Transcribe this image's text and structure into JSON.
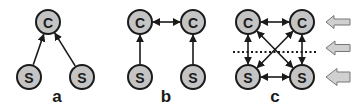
{
  "diagram": {
    "node_fill": "#c4c4c4",
    "stroke_color": "#1a1a1a",
    "panels": [
      {
        "id": "a",
        "label": "a",
        "nodes": [
          {
            "id": "a-c",
            "text": "C",
            "x": 48,
            "y": 22
          },
          {
            "id": "a-s1",
            "text": "S",
            "x": 29,
            "y": 77
          },
          {
            "id": "a-s2",
            "text": "S",
            "x": 82,
            "y": 77
          }
        ],
        "edges": [
          {
            "from": "a-s1",
            "to": "a-c",
            "type": "directed"
          },
          {
            "from": "a-s2",
            "to": "a-c",
            "type": "directed"
          }
        ]
      },
      {
        "id": "b",
        "label": "b",
        "nodes": [
          {
            "id": "b-c1",
            "text": "C",
            "x": 140,
            "y": 22
          },
          {
            "id": "b-c2",
            "text": "C",
            "x": 193,
            "y": 22
          },
          {
            "id": "b-s1",
            "text": "S",
            "x": 140,
            "y": 77
          },
          {
            "id": "b-s2",
            "text": "S",
            "x": 193,
            "y": 77
          }
        ],
        "edges": [
          {
            "from": "b-s1",
            "to": "b-c1",
            "type": "directed"
          },
          {
            "from": "b-s2",
            "to": "b-c2",
            "type": "directed"
          },
          {
            "from": "b-c1",
            "to": "b-c2",
            "type": "bidirectional"
          }
        ]
      },
      {
        "id": "c",
        "label": "c",
        "nodes": [
          {
            "id": "c-c1",
            "text": "C",
            "x": 248,
            "y": 22
          },
          {
            "id": "c-c2",
            "text": "C",
            "x": 302,
            "y": 22
          },
          {
            "id": "c-s1",
            "text": "S",
            "x": 248,
            "y": 77
          },
          {
            "id": "c-s2",
            "text": "S",
            "x": 302,
            "y": 77
          }
        ],
        "edges": [
          {
            "from": "c-c1",
            "to": "c-c2",
            "type": "bidirectional"
          },
          {
            "from": "c-s1",
            "to": "c-s2",
            "type": "bidirectional"
          },
          {
            "from": "c-c1",
            "to": "c-s1",
            "type": "bidirectional"
          },
          {
            "from": "c-c2",
            "to": "c-s2",
            "type": "bidirectional"
          },
          {
            "from": "c-c1",
            "to": "c-s2",
            "type": "bidirectional"
          },
          {
            "from": "c-c2",
            "to": "c-s1",
            "type": "bidirectional"
          }
        ],
        "dotted_separator": {
          "x1": 233,
          "x2": 318,
          "y": 52
        },
        "side_arrows": [
          {
            "level": "top",
            "size": "small",
            "y": 22
          },
          {
            "level": "middle",
            "size": "medium",
            "y": 48
          },
          {
            "level": "bottom",
            "size": "large",
            "y": 77
          }
        ]
      }
    ]
  }
}
